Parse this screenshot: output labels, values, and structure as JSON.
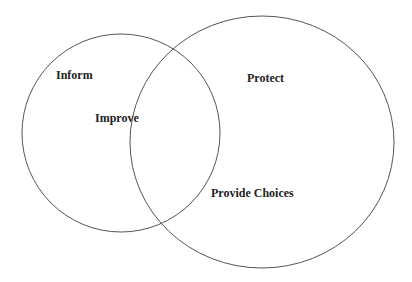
{
  "diagram": {
    "type": "venn",
    "stroke_color": "#555555",
    "text_color": "#222222",
    "background": "#ffffff",
    "sets": [
      {
        "id": "left",
        "cx": 121,
        "cy": 133,
        "r": 99
      },
      {
        "id": "right",
        "cx": 262,
        "cy": 142,
        "rx": 132,
        "ry": 126
      }
    ],
    "labels": [
      {
        "id": "inform",
        "text": "Inform",
        "region": "left-only",
        "x": 56,
        "y": 69
      },
      {
        "id": "improve",
        "text": "Improve",
        "region": "intersection",
        "x": 95,
        "y": 112
      },
      {
        "id": "protect",
        "text": "Protect",
        "region": "right-only",
        "x": 247,
        "y": 72
      },
      {
        "id": "provide-choices",
        "text": "Provide Choices",
        "region": "right-only",
        "x": 211,
        "y": 187
      }
    ]
  }
}
